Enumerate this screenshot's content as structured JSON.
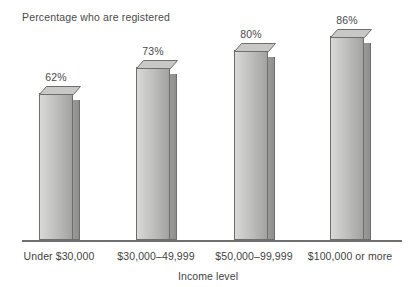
{
  "chart_data": {
    "type": "bar",
    "title": "Percentage who are registered",
    "xlabel": "Income level",
    "ylabel": "",
    "categories": [
      "Under $30,000",
      "$30,000–49,999",
      "$50,000–99,999",
      "$100,000 or more"
    ],
    "values": [
      62,
      73,
      80,
      86
    ],
    "value_labels": [
      "62%",
      "73%",
      "80%",
      "86%"
    ],
    "ylim": [
      0,
      100
    ],
    "grid": false,
    "legend": null,
    "style": {
      "bar_fill_light": "#d9d9d7",
      "bar_fill_dark": "#a2a2a0",
      "bar_side": "#9a9a98",
      "bar_outline": "#6e6e6e",
      "axis_color": "#6f6f6f",
      "text_color": "#3f3f3f",
      "background": "#ffffff",
      "three_d": true
    }
  }
}
